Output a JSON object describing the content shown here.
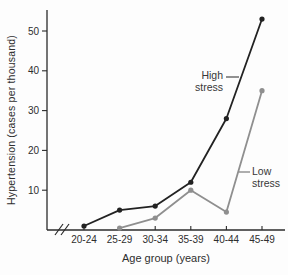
{
  "chart_data": {
    "type": "line",
    "title": "",
    "xlabel": "Age group (years)",
    "ylabel": "Hypertension (cases per thousand)",
    "categories": [
      "20-24",
      "25-29",
      "30-34",
      "35-39",
      "40-44",
      "45-49"
    ],
    "series": [
      {
        "name": "High stress",
        "color": "#222222",
        "marker": "circle",
        "values": [
          1,
          5,
          6,
          12,
          28,
          53
        ]
      },
      {
        "name": "Low stress",
        "color": "#8f8f8f",
        "marker": "circle",
        "values": [
          null,
          0.5,
          3,
          10,
          4.5,
          35
        ]
      }
    ],
    "y_ticks": [
      10,
      20,
      30,
      40,
      50
    ],
    "ylim": [
      0,
      55
    ],
    "grid": false,
    "legend_position": "inline-annotations",
    "x_axis_break": true,
    "annotations": [
      {
        "series": "High stress",
        "lines": [
          "High",
          "stress"
        ]
      },
      {
        "series": "Low stress",
        "lines": [
          "Low",
          "stress"
        ]
      }
    ],
    "colors": {
      "axis": "#2b2b2b",
      "tick_text": "#2e2e2e",
      "background": "#fdfdfd"
    }
  }
}
